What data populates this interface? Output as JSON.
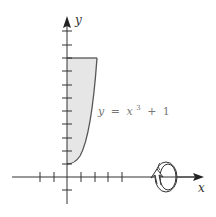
{
  "figure": {
    "type": "solid of revolution region",
    "axes": {
      "x_label": "x",
      "y_label": "y",
      "x_ticks_negative": 2,
      "x_ticks_positive": 4,
      "y_ticks_positive": 11,
      "y_ticks_negative": 1
    },
    "curve": {
      "equation_lhs": "y",
      "equation_eq": "=",
      "equation_var": "x",
      "equation_exp": "3",
      "equation_plus": "+",
      "equation_const": "1",
      "domain": [
        0,
        2
      ],
      "range": [
        1,
        9
      ]
    },
    "region": {
      "description": "Region bounded by y = x^3 + 1, the y-axis, and y = 9",
      "fill_color": "#e6e6e6",
      "stroke_color": "#555555"
    },
    "rotation": {
      "axis": "x",
      "icon": "rotation-arrow-icon"
    },
    "colors": {
      "axis": "#333333",
      "curve": "#555555",
      "shade": "#e6e6e6",
      "label": "#777777"
    }
  }
}
